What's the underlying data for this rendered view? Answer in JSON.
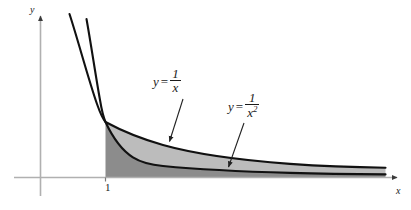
{
  "figure": {
    "background_color": "#ffffff"
  },
  "axes": {
    "x_axis_label": "x",
    "y_axis_label": "y",
    "axis_color": "#b0b0b0",
    "x_ticks": [
      {
        "label": "1",
        "value": 1
      }
    ],
    "y_ticks": [],
    "x_range": [
      0,
      8.2
    ],
    "y_range": [
      0,
      3.6
    ],
    "arrowheads": [
      "x-positive",
      "y-positive"
    ]
  },
  "curves": [
    {
      "name": "reciprocal",
      "equation_lhs": "y",
      "equation_numerator": "1",
      "equation_denominator": "x",
      "color": "#111111",
      "line_width": 2.0
    },
    {
      "name": "reciprocal-squared",
      "equation_lhs": "y",
      "equation_numerator": "1",
      "equation_denominator_base": "x",
      "equation_denominator_exponent": "2",
      "color": "#111111",
      "line_width": 2.0
    }
  ],
  "labels": {
    "curve_1": {
      "lhs": "y",
      "equals": "=",
      "numerator": "1",
      "denominator": "x",
      "points_to": "reciprocal"
    },
    "curve_2": {
      "lhs": "y",
      "equals": "=",
      "numerator": "1",
      "denominator_base": "x",
      "denominator_exponent": "2",
      "points_to": "reciprocal-squared"
    }
  },
  "shaded_regions": [
    {
      "name": "region-under-reciprocal-squared",
      "description": "Dark gray region bounded above by y = 1/x^2, below by the x-axis, left by x = 1",
      "fill_color": "#8c8c8c",
      "shade": "dark"
    },
    {
      "name": "region-between-curves",
      "description": "Light gray region between y = 1/x above and y = 1/x^2 below, starting at x = 1",
      "fill_color": "#bcbcbc",
      "shade": "light"
    }
  ],
  "leader_arrows": [
    {
      "name": "leader-to-reciprocal",
      "from": "curve_1_label",
      "to": "reciprocal"
    },
    {
      "name": "leader-to-reciprocal-squared",
      "from": "curve_2_label",
      "to": "reciprocal-squared"
    }
  ]
}
